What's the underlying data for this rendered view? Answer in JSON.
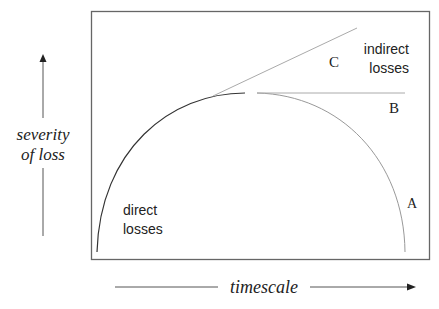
{
  "diagram": {
    "y_axis_label_line1": "severity",
    "y_axis_label_line2": "of loss",
    "x_axis_label": "timescale",
    "direct_label_line1": "direct",
    "direct_label_line2": "losses",
    "indirect_label_line1": "indirect",
    "indirect_label_line2": "losses",
    "curve_labels": {
      "a": "A",
      "b": "B",
      "c": "C"
    },
    "colors": {
      "frame": "#555555",
      "direct_curve": "#333333",
      "indirect_curves": "#999999",
      "text": "#222222"
    }
  }
}
